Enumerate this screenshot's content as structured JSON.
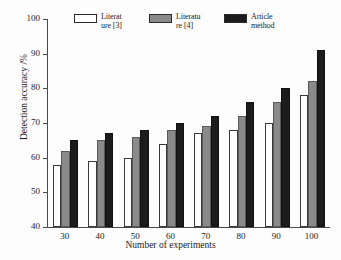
{
  "chart_data": {
    "type": "bar",
    "title": "",
    "subtitle": "",
    "xlabel": "Number of experiments",
    "ylabel": "Detection accuracy /%",
    "categories": [
      "30",
      "40",
      "50",
      "60",
      "70",
      "80",
      "90",
      "100"
    ],
    "series": [
      {
        "name": "Literat\nure [3]",
        "color": "#ffffff",
        "values": [
          58,
          59,
          60,
          64,
          67,
          68,
          70,
          78
        ]
      },
      {
        "name": "Literatu\nre [4]",
        "color": "#8a8a8a",
        "values": [
          62,
          65,
          66,
          68,
          69,
          72,
          76,
          82
        ]
      },
      {
        "name": "Article\nmethod",
        "color": "#1c1c1c",
        "values": [
          65,
          67,
          68,
          70,
          72,
          76,
          80,
          91
        ]
      }
    ],
    "ylim": [
      40,
      100
    ],
    "yticks": [
      "40",
      "50",
      "60",
      "70",
      "80",
      "90",
      "100"
    ],
    "xlim_note": "categorical",
    "grid": false,
    "legend_position": "top",
    "annotations": []
  }
}
